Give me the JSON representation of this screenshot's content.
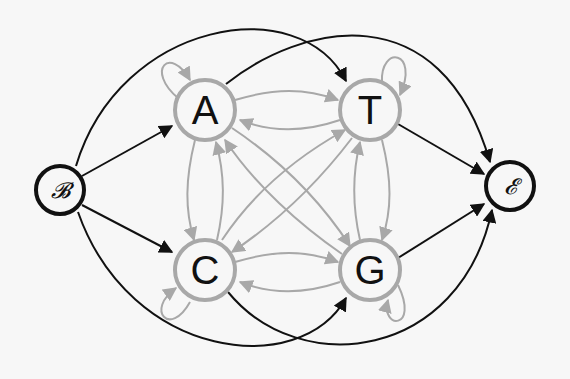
{
  "diagram": {
    "type": "state-transition-graph",
    "colors": {
      "background": "#f7f7f7",
      "terminal_stroke": "#111111",
      "state_stroke": "#a8a8a8",
      "internal_edge": "#a8a8a8",
      "terminal_edge": "#111111"
    },
    "nodes": [
      {
        "id": "B",
        "label": "𝓑",
        "kind": "begin"
      },
      {
        "id": "A",
        "label": "A",
        "kind": "state"
      },
      {
        "id": "T",
        "label": "T",
        "kind": "state"
      },
      {
        "id": "C",
        "label": "C",
        "kind": "state"
      },
      {
        "id": "G",
        "label": "G",
        "kind": "state"
      },
      {
        "id": "E",
        "label": "𝓔",
        "kind": "end"
      }
    ],
    "edges_begin": [
      "B→A",
      "B→C",
      "B→T",
      "B→G"
    ],
    "edges_end": [
      "A→E",
      "T→E",
      "C→E",
      "G→E"
    ],
    "edges_internal": [
      "A→A",
      "T→T",
      "C→C",
      "G→G",
      "A→T",
      "T→A",
      "C→G",
      "G→C",
      "A→C",
      "C→A",
      "T→G",
      "G→T",
      "A→G",
      "G→A",
      "T→C",
      "C→T"
    ]
  }
}
